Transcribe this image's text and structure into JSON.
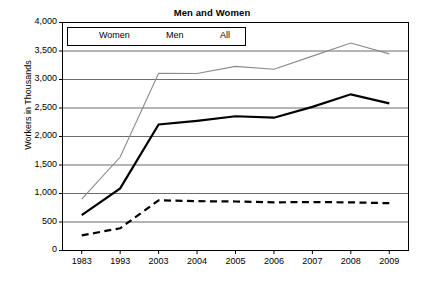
{
  "chart_data": {
    "type": "line",
    "title": "Men and Women",
    "xlabel": "",
    "ylabel": "Workers in Thousands",
    "categories": [
      "1983",
      "1993",
      "2003",
      "2004",
      "2005",
      "2006",
      "2007",
      "2008",
      "2009"
    ],
    "ylim": [
      0,
      4000
    ],
    "y_ticks": [
      "0",
      "500",
      "1,000",
      "1,500",
      "2,000",
      "2,500",
      "3,000",
      "3,500",
      "4,000"
    ],
    "y_tick_values": [
      0,
      500,
      1000,
      1500,
      2000,
      2500,
      3000,
      3500,
      4000
    ],
    "grid": true,
    "legend_position": "top-left-inside",
    "series": [
      {
        "name": "Women",
        "style": "dashed",
        "color": "#000000",
        "values": [
          265,
          390,
          880,
          865,
          860,
          845,
          850,
          845,
          830
        ]
      },
      {
        "name": "Men",
        "style": "solid-thick",
        "color": "#000000",
        "values": [
          620,
          1090,
          2210,
          2275,
          2355,
          2330,
          2520,
          2740,
          2580
        ]
      },
      {
        "name": "All",
        "style": "solid-thin",
        "color": "#8a8a8a",
        "values": [
          900,
          1640,
          3110,
          3105,
          3230,
          3180,
          3410,
          3640,
          3450
        ]
      }
    ]
  },
  "legend": {
    "items": [
      {
        "label": "Women"
      },
      {
        "label": "Men"
      },
      {
        "label": "All"
      }
    ]
  }
}
